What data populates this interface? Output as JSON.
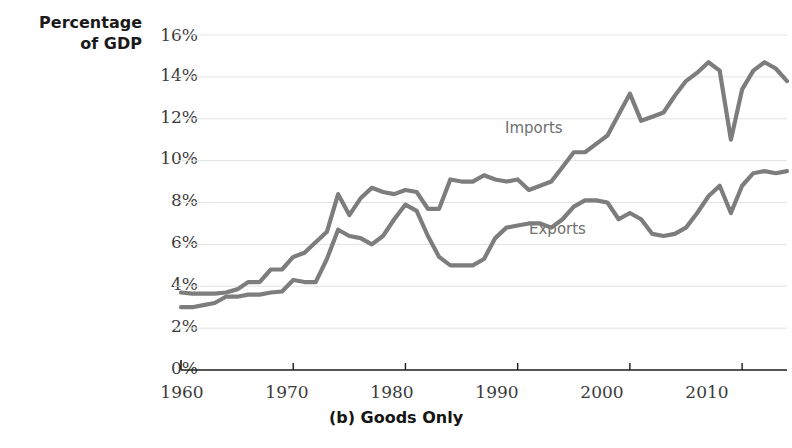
{
  "axes": {
    "y_label_line1": "Percentage",
    "y_label_line2": "of GDP",
    "y_ticks": [
      "0%",
      "2%",
      "4%",
      "6%",
      "8%",
      "10%",
      "12%",
      "14%",
      "16%"
    ],
    "x_ticks": [
      "1960",
      "1970",
      "1980",
      "1990",
      "2000",
      "2010"
    ]
  },
  "title": "(b) Goods Only",
  "legend": {
    "imports": "Imports",
    "exports": "Exports"
  },
  "colors": {
    "line": "#7d7d7d",
    "grid": "#e3e3e3",
    "axis": "#1c1c1c",
    "label_text": "#6f6f6f",
    "tick_text": "#3b3b3b",
    "title_text": "#151515"
  },
  "chart_data": {
    "type": "line",
    "title": "(b) Goods Only",
    "xlabel": "",
    "ylabel": "Percentage of GDP",
    "xlim": [
      1960,
      2014
    ],
    "ylim": [
      0,
      16
    ],
    "yticks": [
      0,
      2,
      4,
      6,
      8,
      10,
      12,
      14,
      16
    ],
    "ytick_labels": [
      "0%",
      "2%",
      "4%",
      "6%",
      "8%",
      "10%",
      "12%",
      "14%",
      "16%"
    ],
    "xticks": [
      1960,
      1970,
      1980,
      1990,
      2000,
      2010
    ],
    "grid": true,
    "legend_position": "inline-annotation",
    "x": [
      1960,
      1961,
      1962,
      1963,
      1964,
      1965,
      1966,
      1967,
      1968,
      1969,
      1970,
      1971,
      1972,
      1973,
      1974,
      1975,
      1976,
      1977,
      1978,
      1979,
      1980,
      1981,
      1982,
      1983,
      1984,
      1985,
      1986,
      1987,
      1988,
      1989,
      1990,
      1991,
      1992,
      1993,
      1994,
      1995,
      1996,
      1997,
      1998,
      1999,
      2000,
      2001,
      2002,
      2003,
      2004,
      2005,
      2006,
      2007,
      2008,
      2009,
      2010,
      2011,
      2012,
      2013,
      2014
    ],
    "series": [
      {
        "name": "Imports",
        "values": [
          3.7,
          3.65,
          3.65,
          3.65,
          3.7,
          3.85,
          4.2,
          4.2,
          4.8,
          4.8,
          5.4,
          5.6,
          6.1,
          6.6,
          8.4,
          7.4,
          8.2,
          8.7,
          8.5,
          8.4,
          8.6,
          8.5,
          7.7,
          7.7,
          9.1,
          9.0,
          9.0,
          9.3,
          9.1,
          9.0,
          9.1,
          8.6,
          8.8,
          9.0,
          9.7,
          10.4,
          10.4,
          10.8,
          11.2,
          12.2,
          13.2,
          11.9,
          12.1,
          12.3,
          13.1,
          13.8,
          14.2,
          14.7,
          14.3,
          11.0,
          13.4,
          14.3,
          14.7,
          14.4,
          13.8
        ]
      },
      {
        "name": "Exports",
        "values": [
          3.0,
          3.0,
          3.1,
          3.2,
          3.5,
          3.5,
          3.6,
          3.6,
          3.7,
          3.75,
          4.3,
          4.2,
          4.2,
          5.3,
          6.7,
          6.4,
          6.3,
          6.0,
          6.4,
          7.2,
          7.9,
          7.6,
          6.4,
          5.4,
          5.0,
          5.0,
          5.0,
          5.3,
          6.3,
          6.8,
          6.9,
          7.0,
          7.0,
          6.8,
          7.2,
          7.8,
          8.1,
          8.1,
          8.0,
          7.2,
          7.5,
          7.2,
          6.5,
          6.4,
          6.5,
          6.8,
          7.5,
          8.3,
          8.8,
          7.5,
          8.8,
          9.4,
          9.5,
          9.4,
          9.5
        ]
      }
    ]
  }
}
